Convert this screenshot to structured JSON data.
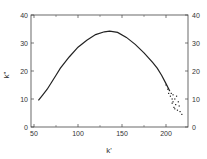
{
  "chart_data": {
    "type": "line",
    "title": "",
    "xlabel": "k'",
    "ylabel": "k\"",
    "xlim": [
      47,
      225
    ],
    "ylim": [
      0,
      40
    ],
    "xticks": [
      50,
      100,
      150,
      200
    ],
    "yticks": [
      0,
      10,
      20,
      30,
      40
    ],
    "right_yticks": [
      0,
      10,
      20,
      30,
      40
    ],
    "grid": false,
    "legend": null,
    "series": [
      {
        "name": "curve",
        "style": "line",
        "x": [
          55,
          60,
          65,
          70,
          75,
          80,
          90,
          100,
          110,
          120,
          130,
          136,
          145,
          155,
          165,
          175,
          185,
          190,
          195,
          200,
          204
        ],
        "y": [
          9.5,
          11.5,
          13.5,
          16,
          18.5,
          21,
          25,
          28.5,
          31,
          33,
          34,
          34.2,
          33.8,
          32,
          29.5,
          26.5,
          23,
          21,
          18.5,
          15.5,
          13
        ]
      },
      {
        "name": "scatter-tail",
        "style": "scatter",
        "x": [
          200,
          202,
          203,
          204,
          205,
          206,
          207,
          207,
          208,
          208,
          209,
          210,
          210,
          211,
          212,
          213,
          214,
          215,
          216,
          218
        ],
        "y": [
          15,
          13.5,
          12,
          13,
          11,
          12,
          10,
          8.5,
          11.5,
          9,
          7,
          10,
          6.5,
          8,
          11,
          6,
          9,
          7.5,
          5.5,
          4.5
        ]
      }
    ],
    "annotations": []
  }
}
